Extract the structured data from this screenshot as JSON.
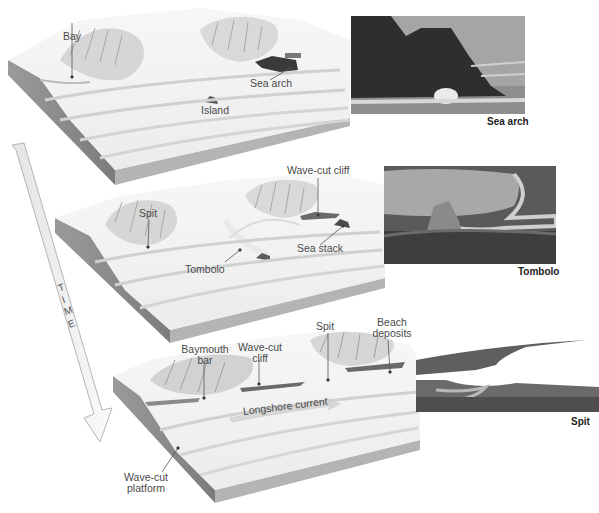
{
  "figure": {
    "time_arrow": {
      "letters": [
        "T",
        "I",
        "M",
        "E"
      ],
      "label": "TIME"
    },
    "stages": [
      {
        "id": "stage-1",
        "labels": {
          "bay": "Bay",
          "sea_arch": "Sea arch",
          "island": "Island"
        }
      },
      {
        "id": "stage-2",
        "labels": {
          "wave_cut_cliff": "Wave-cut cliff",
          "spit": "Spit",
          "tombolo": "Tombolo",
          "sea_stack": "Sea stack"
        }
      },
      {
        "id": "stage-3",
        "labels": {
          "baymouth_bar_1": "Baymouth",
          "baymouth_bar_2": "bar",
          "wave_cut_cliff_1": "Wave-cut",
          "wave_cut_cliff_2": "cliff",
          "spit": "Spit",
          "beach_deposits_1": "Beach",
          "beach_deposits_2": "deposits",
          "longshore_current": "Longshore current",
          "wave_cut_platform_1": "Wave-cut",
          "wave_cut_platform_2": "platform"
        }
      }
    ],
    "photos": [
      {
        "id": "photo-sea-arch",
        "caption": "Sea arch"
      },
      {
        "id": "photo-tombolo",
        "caption": "Tombolo"
      },
      {
        "id": "photo-spit",
        "caption": "Spit"
      }
    ],
    "colors": {
      "block_top": "#f2f2f2",
      "block_side": "#8e8e8e",
      "block_front": "#bdbdbd",
      "ridge": "#c8c8c8",
      "label_text": "#4a4a4a",
      "caption_text": "#222222",
      "arrow_fill": "#f0f0f0",
      "arrow_stroke": "#b0b0b0"
    }
  }
}
